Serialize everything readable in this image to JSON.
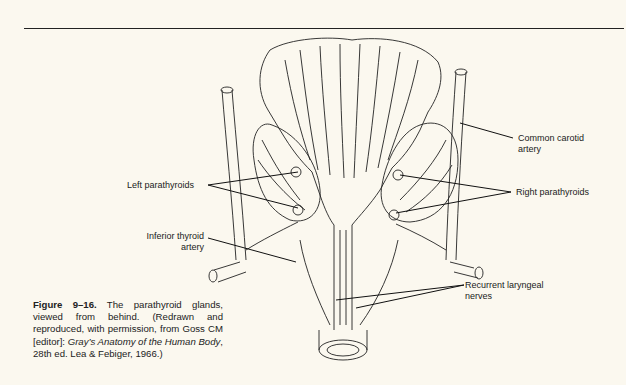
{
  "figure": {
    "number": "Figure 9–16.",
    "caption_text": " The parathyroid glands, viewed from behind. (Redrawn and reproduced, with permission, from Goss CM [editor]: ",
    "caption_italic": "Gray’s Anatomy of the Human Body",
    "caption_tail": ", 28th ed. Lea & Febiger, 1966.)"
  },
  "labels": {
    "common_carotid": [
      "Common carotid",
      "artery"
    ],
    "left_parathyroids": "Left parathyroids",
    "right_parathyroids": "Right parathyroids",
    "inferior_thyroid": [
      "Inferior thyroid",
      "artery"
    ],
    "recurrent_laryngeal": [
      "Recurrent laryngeal",
      "nerves"
    ]
  }
}
